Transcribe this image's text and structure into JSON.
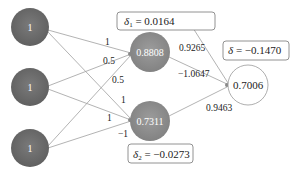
{
  "title": "",
  "colors": {
    "input_node": "#6e6e6e",
    "hidden_node": "#8e8e8e",
    "output_node": "#ffffff",
    "edge": "#9a9a9a",
    "box_border": "#777777"
  },
  "nodes": {
    "inputs": [
      {
        "label": "1"
      },
      {
        "label": "1"
      },
      {
        "label": "1"
      }
    ],
    "hidden": [
      {
        "label": "0.8808"
      },
      {
        "label": "0.7311"
      }
    ],
    "output": {
      "label": "0.7006"
    }
  },
  "weights": {
    "in1_h1": "1",
    "in2_h1": "0.5",
    "in3_h1": "0.5",
    "in1_h2": "1",
    "in2_h2": "1",
    "in3_h2": "−1",
    "h1_out": "−1.0647",
    "h2_out": "0.9463",
    "bias_out": "0.9265"
  },
  "deltas": {
    "delta1": {
      "symbol": "δ",
      "sub": "1",
      "value": " = 0.0164"
    },
    "delta2": {
      "symbol": "δ",
      "sub": "2",
      "value": " = −0.0273"
    },
    "delta_out": {
      "symbol": "δ",
      "value": " = −0.1470"
    }
  }
}
